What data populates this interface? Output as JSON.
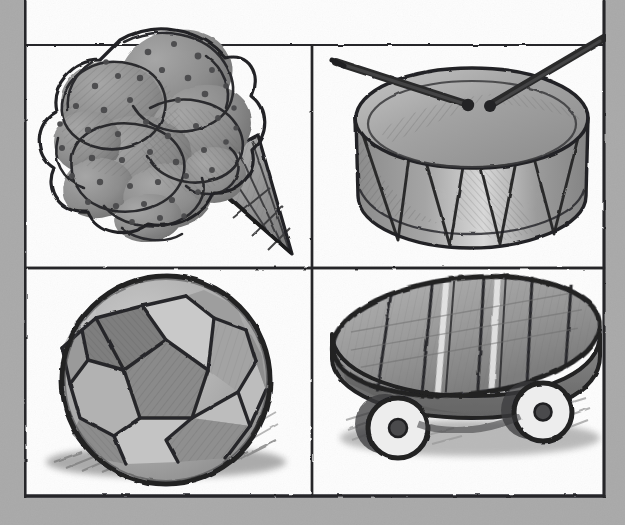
{
  "sheet": {
    "title": "Toys and Treats Sketch Grid",
    "medium": "pencil sketch, grayscale",
    "paper_color": "#a9a9a9",
    "panel_color": "#fdfdfd",
    "ink_color": "#2e2e2e",
    "frame": {
      "left": 25,
      "top": 45,
      "right": 604,
      "bottom": 497,
      "divider_x": 312,
      "divider_y": 268,
      "line_color": "#26262a"
    },
    "grid": {
      "rows": 2,
      "columns": 2,
      "panel_count": 4
    }
  },
  "panels": [
    {
      "id": "panel-ice-cream-cone",
      "position": "top-left",
      "subject": "ice cream cone",
      "caption": "Ice cream cone with three speckled scoops in a waffle cone",
      "elements": [
        "scoops",
        "chocolate-chip-speckles",
        "waffle-cone",
        "cross-hatch-lattice"
      ],
      "scoop_count": 3,
      "speckle_count": 46,
      "fill": "#8f8f8f",
      "shade": "#6f6f6f",
      "highlight": "#b9b9b9"
    },
    {
      "id": "panel-snare-drum",
      "position": "top-right",
      "subject": "snare drum",
      "caption": "Snare drum with zigzag tension ropes and two crossed drumsticks",
      "elements": [
        "drum-head",
        "drum-shell",
        "zigzag-tension-ropes",
        "drumstick-left",
        "drumstick-right"
      ],
      "drumstick_count": 2,
      "zigzag_points": 6,
      "fill": "#9a9a9a",
      "shade": "#707070",
      "highlight": "#e2e2e2"
    },
    {
      "id": "panel-soccer-ball",
      "position": "bottom-left",
      "subject": "soccer ball",
      "caption": "Soccer ball resting on the ground with a hatched cast shadow",
      "elements": [
        "pentagon-panels",
        "hexagon-panels",
        "ground-shadow"
      ],
      "panel_faces": 13,
      "fill": "#b5b5b5",
      "shade": "#7c7c7c",
      "highlight": "#d6d6d6"
    },
    {
      "id": "panel-skateboard",
      "position": "bottom-right",
      "subject": "skateboard",
      "caption": "Oval skateboard deck with racing stripes and two wheels",
      "elements": [
        "oval-deck",
        "deck-stripes",
        "deck-rail",
        "wheel-front",
        "wheel-rear",
        "ground-shadow"
      ],
      "wheel_count": 2,
      "stripe_count": 6,
      "fill": "#9d9d9d",
      "shade": "#6d6d6d",
      "highlight": "#d9d9d9"
    }
  ]
}
